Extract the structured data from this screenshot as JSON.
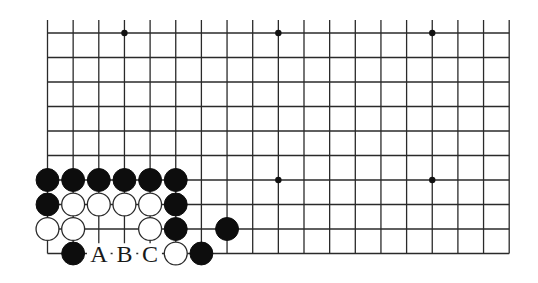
{
  "diagram": {
    "type": "go-board-fragment",
    "columns": 19,
    "rows_shown": 10,
    "open_edge": "top",
    "origin": {
      "x": 47.5,
      "y": 33
    },
    "spacing": {
      "x": 25.65,
      "y": 24.5
    },
    "top_line_extension": 13,
    "star_points": [
      [
        3,
        0
      ],
      [
        9,
        0
      ],
      [
        15,
        0
      ],
      [
        3,
        6
      ],
      [
        9,
        6
      ],
      [
        15,
        6
      ]
    ],
    "stones": [
      {
        "col": 0,
        "row": 6,
        "color": "black"
      },
      {
        "col": 1,
        "row": 6,
        "color": "black"
      },
      {
        "col": 2,
        "row": 6,
        "color": "black"
      },
      {
        "col": 3,
        "row": 6,
        "color": "black"
      },
      {
        "col": 4,
        "row": 6,
        "color": "black"
      },
      {
        "col": 5,
        "row": 6,
        "color": "black"
      },
      {
        "col": 0,
        "row": 7,
        "color": "black"
      },
      {
        "col": 1,
        "row": 7,
        "color": "white"
      },
      {
        "col": 2,
        "row": 7,
        "color": "white"
      },
      {
        "col": 3,
        "row": 7,
        "color": "white"
      },
      {
        "col": 4,
        "row": 7,
        "color": "white"
      },
      {
        "col": 5,
        "row": 7,
        "color": "black"
      },
      {
        "col": 0,
        "row": 8,
        "color": "white"
      },
      {
        "col": 1,
        "row": 8,
        "color": "white"
      },
      {
        "col": 4,
        "row": 8,
        "color": "white"
      },
      {
        "col": 5,
        "row": 8,
        "color": "black"
      },
      {
        "col": 7,
        "row": 8,
        "color": "black"
      },
      {
        "col": 1,
        "row": 9,
        "color": "black"
      },
      {
        "col": 5,
        "row": 9,
        "color": "white"
      },
      {
        "col": 6,
        "row": 9,
        "color": "black"
      }
    ],
    "labels": [
      {
        "col": 2,
        "row": 9,
        "text": "A"
      },
      {
        "col": 3,
        "row": 9,
        "text": "B"
      },
      {
        "col": 4,
        "row": 9,
        "text": "C"
      }
    ],
    "colors": {
      "black_stone": "#0d0d0d",
      "white_stone": "#ffffff",
      "line": "#2a2a2a",
      "background": "#ffffff"
    }
  }
}
